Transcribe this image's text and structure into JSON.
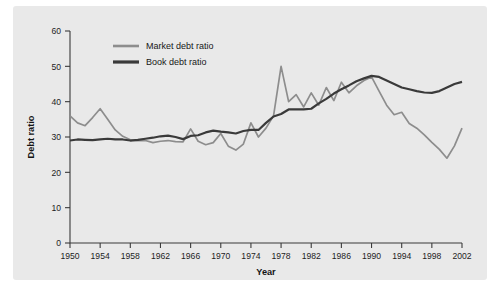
{
  "chart_data": {
    "type": "line",
    "title": "",
    "xlabel": "Year",
    "ylabel": "Debt ratio",
    "xlim": [
      1950,
      2002
    ],
    "ylim": [
      0,
      60
    ],
    "xticks": [
      1950,
      1954,
      1958,
      1962,
      1966,
      1970,
      1974,
      1978,
      1982,
      1986,
      1990,
      1994,
      1998,
      2002
    ],
    "yticks": [
      0,
      10,
      20,
      30,
      40,
      50,
      60
    ],
    "grid": false,
    "legend_position": "top-center",
    "x": [
      1950,
      1951,
      1952,
      1953,
      1954,
      1955,
      1956,
      1957,
      1958,
      1959,
      1960,
      1961,
      1962,
      1963,
      1964,
      1965,
      1966,
      1967,
      1968,
      1969,
      1970,
      1971,
      1972,
      1973,
      1974,
      1975,
      1976,
      1977,
      1978,
      1979,
      1980,
      1981,
      1982,
      1983,
      1984,
      1985,
      1986,
      1987,
      1988,
      1989,
      1990,
      1991,
      1992,
      1993,
      1994,
      1995,
      1996,
      1997,
      1998,
      1999,
      2000,
      2001,
      2002
    ],
    "series": [
      {
        "name": "Market debt ratio",
        "color": "#8d8d8d",
        "values": [
          36.0,
          34.0,
          33.2,
          35.5,
          38.0,
          35.0,
          32.0,
          30.2,
          29.2,
          29.0,
          29.0,
          28.4,
          28.8,
          29.0,
          28.7,
          28.6,
          32.3,
          28.8,
          27.8,
          28.4,
          31.0,
          27.4,
          26.3,
          28.0,
          34.0,
          30.0,
          32.5,
          36.0,
          50.0,
          40.0,
          42.0,
          38.5,
          42.5,
          39.0,
          44.0,
          40.3,
          45.5,
          42.5,
          44.5,
          46.0,
          47.0,
          43.0,
          39.0,
          36.3,
          37.0,
          33.8,
          32.5,
          30.6,
          28.5,
          26.5,
          24.0,
          27.5,
          32.5
        ]
      },
      {
        "name": "Book debt ratio",
        "color": "#3a3a3a",
        "values": [
          29.0,
          29.3,
          29.2,
          29.1,
          29.3,
          29.5,
          29.3,
          29.3,
          29.0,
          29.2,
          29.5,
          29.8,
          30.2,
          30.4,
          30.0,
          29.4,
          30.3,
          30.5,
          31.3,
          31.8,
          31.5,
          31.3,
          31.0,
          31.7,
          32.0,
          32.0,
          34.0,
          35.8,
          36.5,
          37.8,
          37.8,
          37.8,
          38.0,
          39.5,
          40.8,
          42.3,
          43.5,
          44.6,
          45.8,
          46.6,
          47.3,
          47.0,
          46.0,
          45.0,
          44.0,
          43.5,
          43.0,
          42.6,
          42.5,
          43.0,
          44.0,
          45.0,
          45.6
        ]
      }
    ],
    "legend": [
      {
        "label": "Market debt ratio",
        "color": "#8d8d8d"
      },
      {
        "label": "Book debt ratio",
        "color": "#3a3a3a"
      }
    ]
  }
}
